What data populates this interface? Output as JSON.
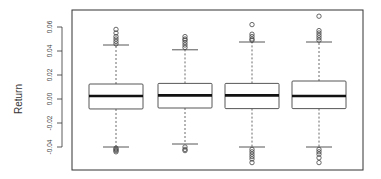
{
  "chart_data": {
    "type": "box",
    "title": "",
    "xlabel": "",
    "ylabel": "Return",
    "ylim": [
      -0.055,
      0.072
    ],
    "yticks": [
      -0.04,
      -0.02,
      0.0,
      0.02,
      0.04,
      0.06
    ],
    "ytick_labels": [
      "-0.04",
      "-0.02",
      "0.00",
      "0.02",
      "0.04",
      "0.06"
    ],
    "grid": false,
    "legend": null,
    "categories": [
      "1",
      "2",
      "3",
      "4"
    ],
    "show_x_labels": false,
    "series": [
      {
        "name": "1",
        "whisker_low": -0.04,
        "q1": -0.0083,
        "median": 0.0025,
        "q3": 0.0125,
        "whisker_high": 0.045,
        "outliers_high": [
          0.046,
          0.048,
          0.05,
          0.052,
          0.055,
          0.058
        ],
        "outliers_low": [
          -0.041,
          -0.042,
          -0.043,
          -0.044
        ]
      },
      {
        "name": "2",
        "whisker_low": -0.0375,
        "q1": -0.0075,
        "median": 0.003,
        "q3": 0.013,
        "whisker_high": 0.041,
        "outliers_high": [
          0.043,
          0.045,
          0.047,
          0.049,
          0.05,
          0.052
        ],
        "outliers_low": [
          -0.04,
          -0.042,
          -0.043
        ]
      },
      {
        "name": "3",
        "whisker_low": -0.04,
        "q1": -0.008,
        "median": 0.003,
        "q3": 0.013,
        "whisker_high": 0.0475,
        "outliers_high": [
          0.049,
          0.05,
          0.052,
          0.054,
          0.062
        ],
        "outliers_low": [
          -0.042,
          -0.044,
          -0.046,
          -0.048,
          -0.05,
          -0.053
        ]
      },
      {
        "name": "4",
        "whisker_low": -0.04,
        "q1": -0.008,
        "median": 0.0025,
        "q3": 0.015,
        "whisker_high": 0.0475,
        "outliers_high": [
          0.049,
          0.051,
          0.053,
          0.055,
          0.057,
          0.069
        ],
        "outliers_low": [
          -0.042,
          -0.044,
          -0.046,
          -0.049,
          -0.053
        ]
      }
    ]
  },
  "colors": {
    "frame": "#333333",
    "box_stroke": "#444444",
    "median": "#111111",
    "whisker": "#444444",
    "outlier": "#444444"
  }
}
